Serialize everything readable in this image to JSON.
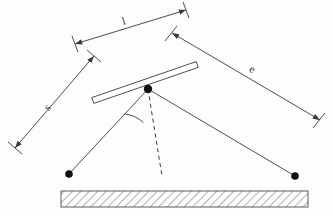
{
  "figure": {
    "background_color": "#fdfdfd",
    "stroke_color": "#3a3a3a",
    "fill_dot_color": "#111111",
    "width": 333,
    "height": 216
  },
  "labels": {
    "length_l": "l",
    "distance_s": "s",
    "distance_e": "e"
  },
  "dimensions": [
    {
      "name": "l",
      "label": "l",
      "from": [
        75,
        44
      ],
      "to": [
        186,
        10
      ],
      "label_pos": [
        124,
        22
      ],
      "label_rotation": -17
    },
    {
      "name": "s",
      "label": "s",
      "from": [
        15,
        148
      ],
      "to": [
        94,
        56
      ],
      "label_pos": [
        48,
        108
      ],
      "label_rotation": -49
    },
    {
      "name": "e",
      "label": "e",
      "from": [
        320,
        120
      ],
      "to": [
        172,
        33
      ],
      "label_pos": [
        252,
        70
      ],
      "label_rotation": 30
    }
  ],
  "mirror_bar": {
    "name": "mirror-bar",
    "start": [
      92,
      101
    ],
    "end": [
      197,
      65
    ],
    "thickness": 7
  },
  "pivot": {
    "name": "pivot-point",
    "position": [
      148,
      89
    ],
    "radius": 4.2
  },
  "rays": [
    {
      "name": "incident-ray",
      "from": [
        148,
        89
      ],
      "to": [
        69,
        174
      ],
      "style": "solid",
      "endpoint_dot": true
    },
    {
      "name": "reflected-ray",
      "from": [
        148,
        89
      ],
      "to": [
        295,
        176
      ],
      "style": "solid",
      "endpoint_dot": true
    },
    {
      "name": "normal-line",
      "from": [
        148,
        89
      ],
      "to": [
        162,
        176
      ],
      "style": "dashed",
      "endpoint_dot": false
    }
  ],
  "angle_arc": {
    "name": "angle-arc",
    "center": [
      148,
      89
    ],
    "radius": 34,
    "from_deg": 133,
    "to_deg": 81
  },
  "ground": {
    "name": "hatched-ground-block",
    "x": 61,
    "y": 191,
    "width": 247,
    "height": 16,
    "hatch_spacing": 5,
    "hatch_angle": 45
  }
}
